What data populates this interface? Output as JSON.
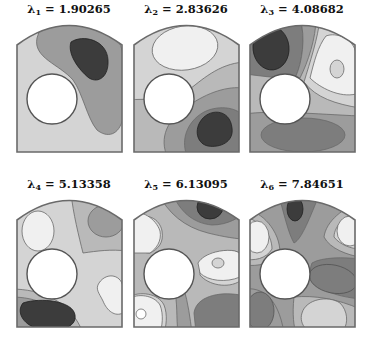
{
  "figure": {
    "panels": [
      {
        "symbol": "λ",
        "subscript": "1",
        "eq": " = ",
        "value": "1.90265"
      },
      {
        "symbol": "λ",
        "subscript": "2",
        "eq": " = ",
        "value": "2.83626"
      },
      {
        "symbol": "λ",
        "subscript": "3",
        "eq": " = ",
        "value": "4.08682"
      },
      {
        "symbol": "λ",
        "subscript": "4",
        "eq": " = ",
        "value": "5.13358"
      },
      {
        "symbol": "λ",
        "subscript": "5",
        "eq": " = ",
        "value": "6.13095"
      },
      {
        "symbol": "λ",
        "subscript": "6",
        "eq": " = ",
        "value": "7.84651"
      }
    ],
    "colors": {
      "level_1": "#f0f0f0",
      "level_2": "#d4d4d4",
      "level_3": "#b9b9b9",
      "level_4": "#9c9c9c",
      "level_5": "#7d7d7d",
      "level_6": "#3c3c3c",
      "outline": "#6a6a6a",
      "hole": "#ffffff"
    }
  }
}
